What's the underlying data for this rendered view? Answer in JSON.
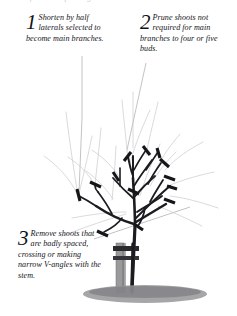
{
  "page": {
    "cropped_header_text": "formative pruning"
  },
  "colors": {
    "ink": "#1b1b20",
    "removed_growth": "#c6c6c6",
    "leader_line": "#9a9a9a",
    "soil": "#8e8e8e",
    "stake": "#8f8f8f",
    "paper": "#ffffff"
  },
  "captions": [
    {
      "number": "1",
      "text": "Shorten by half laterals selected to become main branches."
    },
    {
      "number": "2",
      "text": "Prune shoots not required for main branches to four or five buds."
    },
    {
      "number": "3",
      "text": "Remove shoots that are badly spaced, crossing or making narrow V-angles with the stem."
    }
  ],
  "illustration": {
    "subject": "young-tree-with-stake",
    "parts": [
      {
        "name": "main-stem",
        "label": "stem"
      },
      {
        "name": "tree-stake",
        "label": "stake"
      },
      {
        "name": "tree-tie",
        "label": "tie"
      },
      {
        "name": "soil-mound",
        "label": "soil"
      },
      {
        "name": "retained-branches",
        "label": "main branches (dark)"
      },
      {
        "name": "removed-growth",
        "label": "growth to be removed (pale grey)"
      },
      {
        "name": "pruning-cut-stubs",
        "label": "pruning cuts"
      }
    ],
    "cut_marker_count": 13
  }
}
